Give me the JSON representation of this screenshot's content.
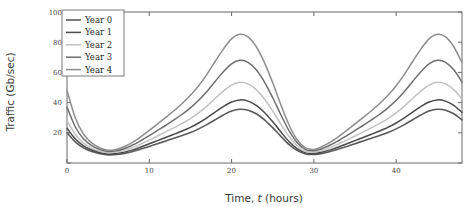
{
  "chart_data": {
    "type": "line",
    "title": "",
    "xlabel": "Time, t (hours)",
    "xlabel_prefix": "Time, ",
    "xlabel_italic": "t",
    "xlabel_suffix": " (hours)",
    "ylabel": "Traffic (Gb/sec)",
    "xlim": [
      0,
      48
    ],
    "ylim": [
      0,
      100
    ],
    "xticks": [
      0,
      10,
      20,
      30,
      40
    ],
    "yticks": [
      0,
      20,
      40,
      60,
      80,
      100
    ],
    "xtick_labels": [
      "0",
      "10",
      "20",
      "30",
      "40"
    ],
    "ytick_labels": [
      "0",
      "20",
      "40",
      "60",
      "80",
      "100"
    ],
    "grid": false,
    "legend_position": "upper-left",
    "x": [
      0,
      1,
      2,
      3,
      4,
      5,
      6,
      7,
      8,
      9,
      10,
      11,
      12,
      13,
      14,
      15,
      16,
      17,
      18,
      19,
      20,
      21,
      22,
      23,
      24,
      25,
      26,
      27,
      28,
      29,
      30,
      31,
      32,
      33,
      34,
      35,
      36,
      37,
      38,
      39,
      40,
      41,
      42,
      43,
      44,
      45,
      46,
      47,
      48
    ],
    "series": [
      {
        "name": "Year 0",
        "color": "#5a5a5a",
        "width": 1.6,
        "values": [
          20.0,
          14.0,
          10.0,
          7.6,
          6.2,
          5.4,
          5.6,
          6.4,
          7.6,
          9.2,
          11.0,
          12.8,
          14.6,
          16.4,
          18.2,
          20.2,
          22.6,
          25.4,
          28.6,
          31.8,
          34.4,
          35.6,
          35.0,
          32.6,
          28.6,
          23.4,
          17.6,
          12.2,
          8.2,
          6.0,
          5.6,
          6.4,
          7.6,
          9.2,
          11.0,
          12.8,
          14.6,
          16.4,
          18.2,
          20.2,
          22.6,
          25.4,
          28.6,
          31.8,
          34.4,
          35.6,
          35.0,
          32.6,
          28.6
        ]
      },
      {
        "name": "Year 1",
        "color": "#4a4a4a",
        "width": 1.5,
        "values": [
          23.0,
          16.0,
          11.4,
          8.6,
          6.9,
          6.0,
          6.3,
          7.2,
          8.7,
          10.6,
          12.7,
          14.8,
          16.9,
          19.0,
          21.2,
          23.6,
          26.5,
          29.9,
          33.7,
          37.4,
          40.4,
          41.8,
          41.0,
          38.2,
          33.5,
          27.3,
          20.5,
          14.1,
          9.4,
          6.7,
          6.3,
          7.2,
          8.7,
          10.6,
          12.7,
          14.8,
          16.9,
          19.0,
          21.2,
          23.6,
          26.5,
          29.9,
          33.7,
          37.4,
          40.4,
          41.8,
          41.0,
          38.2,
          33.5
        ]
      },
      {
        "name": "Year 2",
        "color": "#c2c2c2",
        "width": 1.5,
        "values": [
          28.0,
          19.0,
          13.2,
          9.8,
          7.8,
          6.8,
          7.2,
          8.4,
          10.2,
          12.6,
          15.2,
          17.9,
          20.6,
          23.3,
          26.2,
          29.4,
          33.2,
          37.7,
          42.7,
          47.6,
          51.6,
          53.4,
          52.4,
          48.6,
          42.4,
          34.4,
          25.6,
          17.4,
          11.3,
          7.8,
          7.2,
          8.4,
          10.2,
          12.6,
          15.2,
          17.9,
          20.6,
          23.3,
          26.2,
          29.4,
          33.2,
          37.7,
          42.7,
          47.6,
          51.6,
          53.4,
          52.4,
          48.6,
          42.4
        ]
      },
      {
        "name": "Year 3",
        "color": "#6e6e6e",
        "width": 1.5,
        "values": [
          37.0,
          24.0,
          16.0,
          11.5,
          8.9,
          7.6,
          8.1,
          9.6,
          11.9,
          14.9,
          18.2,
          21.6,
          25.0,
          28.5,
          32.3,
          36.5,
          41.5,
          47.4,
          54.0,
          60.4,
          65.7,
          68.0,
          66.7,
          61.7,
          53.6,
          43.2,
          31.8,
          21.2,
          13.2,
          8.9,
          8.1,
          9.6,
          11.9,
          14.9,
          18.2,
          21.6,
          25.0,
          28.5,
          32.3,
          36.5,
          41.5,
          47.4,
          54.0,
          60.4,
          65.7,
          68.0,
          66.7,
          61.7,
          53.6
        ]
      },
      {
        "name": "Year 4",
        "color": "#8e8e8e",
        "width": 1.5,
        "values": [
          48.0,
          30.0,
          19.2,
          13.3,
          10.0,
          8.4,
          9.0,
          10.9,
          13.8,
          17.5,
          21.6,
          25.9,
          30.2,
          34.6,
          39.4,
          44.8,
          51.2,
          58.7,
          67.2,
          75.4,
          82.2,
          85.2,
          83.5,
          77.0,
          66.5,
          53.1,
          38.4,
          25.0,
          15.1,
          10.0,
          9.0,
          10.9,
          13.8,
          17.5,
          21.6,
          25.9,
          30.2,
          34.6,
          39.4,
          44.8,
          51.2,
          58.7,
          67.2,
          75.4,
          82.2,
          85.2,
          83.5,
          77.0,
          66.5
        ]
      }
    ],
    "legend_entries": [
      "Year 0",
      "Year 1",
      "Year 2",
      "Year 3",
      "Year 4"
    ]
  }
}
